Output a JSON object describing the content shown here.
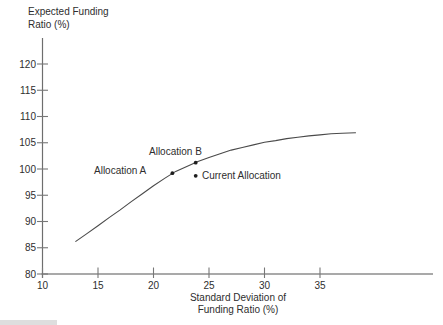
{
  "figure": {
    "y_axis_title": [
      "Expected Funding",
      "Ratio (%)"
    ],
    "x_axis_title": [
      "Standard Deviation of",
      "Funding Ratio (%)"
    ]
  },
  "chart_data": {
    "type": "line",
    "title": "",
    "xlabel": "Standard Deviation of Funding Ratio (%)",
    "ylabel": "Expected Funding Ratio (%)",
    "xlim": [
      10,
      45.5
    ],
    "ylim": [
      80,
      124.5
    ],
    "x_ticks": [
      10,
      15,
      20,
      25,
      30,
      35
    ],
    "y_ticks": [
      80,
      85,
      90,
      95,
      100,
      105,
      110,
      115,
      120
    ],
    "grid": false,
    "legend": "none",
    "colors": {
      "curve": "#4a4a4a",
      "axis": "#8c8c8c",
      "tick": "#777777",
      "marker": "#1e1e1e",
      "text": "#2e2e2e"
    },
    "series": [
      {
        "name": "efficient-frontier-curve",
        "x": [
          13.0,
          14,
          15,
          16,
          17,
          18,
          19,
          20,
          21,
          22,
          23,
          24,
          25,
          26,
          27,
          28,
          29,
          30,
          31,
          32,
          33,
          34,
          35,
          36,
          37,
          38.2
        ],
        "y": [
          86.2,
          87.7,
          89.2,
          90.75,
          92.2,
          93.8,
          95.3,
          96.8,
          98.2,
          99.55,
          100.5,
          101.4,
          102.2,
          102.9,
          103.6,
          104.1,
          104.6,
          105.1,
          105.4,
          105.8,
          106.05,
          106.3,
          106.5,
          106.7,
          106.8,
          106.9
        ]
      }
    ],
    "points": [
      {
        "id": "allocation-a",
        "label": "Allocation A",
        "x": 21.7,
        "y": 99.2,
        "label_side": "left"
      },
      {
        "id": "allocation-b",
        "label": "Allocation B",
        "x": 23.8,
        "y": 101.2,
        "label_side": "above-left"
      },
      {
        "id": "current-allocation",
        "label": "Current Allocation",
        "x": 23.8,
        "y": 98.7,
        "label_side": "right"
      }
    ]
  }
}
